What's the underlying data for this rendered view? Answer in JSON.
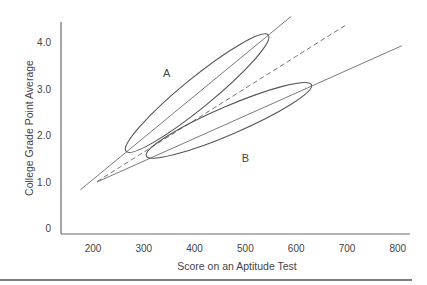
{
  "chart_data": {
    "type": "line",
    "title": "",
    "xlabel": "Score on an Aptitude Test",
    "ylabel": "College Grade Point Average",
    "xlim": [
      140,
      820
    ],
    "ylim": [
      0,
      4.4
    ],
    "x_ticks": [
      200,
      300,
      400,
      500,
      600,
      700,
      800
    ],
    "x_tick_labels": [
      "200",
      "300",
      "400",
      "500",
      "600",
      "700",
      "800"
    ],
    "y_ticks": [
      0,
      1.0,
      2.0,
      3.0,
      4.0
    ],
    "y_tick_labels": [
      "0",
      "1.0",
      "2.0",
      "3.0",
      "4.0"
    ],
    "grid": false,
    "legend": "none",
    "series": [
      {
        "name": "Regression line A (steep)",
        "style": "solid",
        "x": [
          175,
          590
        ],
        "y": [
          0.82,
          4.55
        ]
      },
      {
        "name": "Combined regression line",
        "style": "dashed",
        "x": [
          208,
          700
        ],
        "y": [
          1.0,
          4.38
        ]
      },
      {
        "name": "Regression line B (shallow)",
        "style": "solid",
        "x": [
          208,
          808
        ],
        "y": [
          0.99,
          3.92
        ]
      }
    ],
    "ellipses": [
      {
        "name": "Group A",
        "label": "A",
        "tip1": [
          265,
          1.65
        ],
        "tip2": [
          545,
          4.15
        ],
        "minor_half_width": 0.32,
        "label_pos": [
          345,
          3.25
        ]
      },
      {
        "name": "Group B",
        "label": "B",
        "tip1": [
          305,
          1.55
        ],
        "tip2": [
          630,
          3.08
        ],
        "minor_half_width": 0.3,
        "label_pos": [
          500,
          1.42
        ]
      }
    ],
    "annotations": [
      "A",
      "B"
    ]
  },
  "plot_px": {
    "x0_val": 200,
    "x0_px": 93,
    "px_per_100": 50.8,
    "y0_px": 228,
    "px_per_unit": 46.5,
    "axis_left": 61,
    "axis_bottom": 234,
    "axis_top": 22,
    "axis_right": 410
  }
}
